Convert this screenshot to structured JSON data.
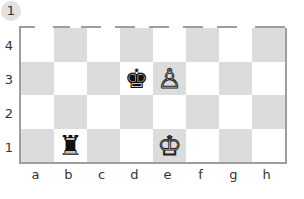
{
  "diagram_number": "1",
  "board": {
    "files": [
      "a",
      "b",
      "c",
      "d",
      "e",
      "f",
      "g",
      "h"
    ],
    "ranks": [
      "4",
      "3",
      "2",
      "1"
    ],
    "colors": {
      "light": "#ffffff",
      "dark": "#dcdcdc",
      "border": "#9e9e9e"
    },
    "rows": [
      {
        "rank": "4",
        "squares": [
          {
            "sq": "a4",
            "shade": "light",
            "piece": ""
          },
          {
            "sq": "b4",
            "shade": "dark",
            "piece": ""
          },
          {
            "sq": "c4",
            "shade": "light",
            "piece": ""
          },
          {
            "sq": "d4",
            "shade": "dark",
            "piece": ""
          },
          {
            "sq": "e4",
            "shade": "light",
            "piece": ""
          },
          {
            "sq": "f4",
            "shade": "dark",
            "piece": ""
          },
          {
            "sq": "g4",
            "shade": "light",
            "piece": ""
          },
          {
            "sq": "h4",
            "shade": "dark",
            "piece": ""
          }
        ]
      },
      {
        "rank": "3",
        "squares": [
          {
            "sq": "a3",
            "shade": "dark",
            "piece": ""
          },
          {
            "sq": "b3",
            "shade": "light",
            "piece": ""
          },
          {
            "sq": "c3",
            "shade": "dark",
            "piece": ""
          },
          {
            "sq": "d3",
            "shade": "light",
            "piece": "♚",
            "side": "black",
            "name": "black-king"
          },
          {
            "sq": "e3",
            "shade": "dark",
            "piece": "♙",
            "side": "white",
            "name": "white-pawn"
          },
          {
            "sq": "f3",
            "shade": "light",
            "piece": ""
          },
          {
            "sq": "g3",
            "shade": "dark",
            "piece": ""
          },
          {
            "sq": "h3",
            "shade": "light",
            "piece": ""
          }
        ]
      },
      {
        "rank": "2",
        "squares": [
          {
            "sq": "a2",
            "shade": "light",
            "piece": ""
          },
          {
            "sq": "b2",
            "shade": "dark",
            "piece": ""
          },
          {
            "sq": "c2",
            "shade": "light",
            "piece": ""
          },
          {
            "sq": "d2",
            "shade": "dark",
            "piece": ""
          },
          {
            "sq": "e2",
            "shade": "light",
            "piece": ""
          },
          {
            "sq": "f2",
            "shade": "dark",
            "piece": ""
          },
          {
            "sq": "g2",
            "shade": "light",
            "piece": ""
          },
          {
            "sq": "h2",
            "shade": "dark",
            "piece": ""
          }
        ]
      },
      {
        "rank": "1",
        "squares": [
          {
            "sq": "a1",
            "shade": "dark",
            "piece": ""
          },
          {
            "sq": "b1",
            "shade": "light",
            "piece": "♜",
            "side": "black",
            "name": "black-rook"
          },
          {
            "sq": "c1",
            "shade": "dark",
            "piece": ""
          },
          {
            "sq": "d1",
            "shade": "light",
            "piece": ""
          },
          {
            "sq": "e1",
            "shade": "dark",
            "piece": "♔",
            "side": "white",
            "name": "white-king"
          },
          {
            "sq": "f1",
            "shade": "light",
            "piece": ""
          },
          {
            "sq": "g1",
            "shade": "dark",
            "piece": ""
          },
          {
            "sq": "h1",
            "shade": "light",
            "piece": ""
          }
        ]
      }
    ]
  }
}
